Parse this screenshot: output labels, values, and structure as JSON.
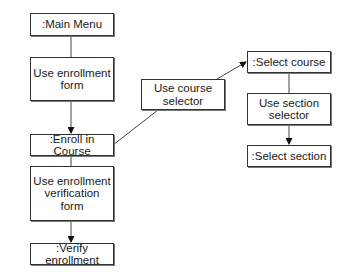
{
  "diagram": {
    "nodes": [
      {
        "id": "main_menu",
        "label": ":Main Menu"
      },
      {
        "id": "use_enrollment_form",
        "label": "Use enrollment form"
      },
      {
        "id": "enroll_in_course",
        "label": ":Enroll in Course"
      },
      {
        "id": "use_course_selector",
        "label": "Use course selector"
      },
      {
        "id": "select_course",
        "label": ":Select course"
      },
      {
        "id": "use_section_selector",
        "label": "Use section selector"
      },
      {
        "id": "select_section",
        "label": ":Select section"
      },
      {
        "id": "use_enrollment_verification_form",
        "label": "Use enrollment verification form"
      },
      {
        "id": "verify_enrollment",
        "label": ":Verify enrollment"
      }
    ],
    "edges": [
      {
        "from": "main_menu",
        "to": "enroll_in_course",
        "via": "use_enrollment_form"
      },
      {
        "from": "enroll_in_course",
        "to": "select_course",
        "via": "use_course_selector"
      },
      {
        "from": "select_course",
        "to": "select_section",
        "via": "use_section_selector"
      },
      {
        "from": "enroll_in_course",
        "to": "verify_enrollment",
        "via": "use_enrollment_verification_form"
      }
    ]
  }
}
